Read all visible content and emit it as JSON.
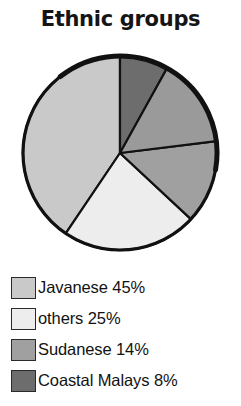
{
  "chart_data": {
    "type": "pie",
    "title": "Ethnic groups",
    "xlabel": "",
    "ylabel": "",
    "legend_position": "bottom",
    "grid": false,
    "categories": [
      "Javanese",
      "others",
      "Sudanese",
      "Coastal Malays",
      ""
    ],
    "values": [
      45,
      25,
      14,
      8,
      8
    ],
    "slices": [
      {
        "label": "Javanese",
        "value": 45,
        "value_label": "45%",
        "legend_text": "Javanese 45%",
        "color": "#c9c9c9",
        "start_angle_deg": 214,
        "end_angle_deg": 360
      },
      {
        "label": "others",
        "value": 25,
        "value_label": "25%",
        "legend_text": "others 25%",
        "color": "#ededed",
        "start_angle_deg": 133,
        "end_angle_deg": 214
      },
      {
        "label": "Sudanese",
        "value": 14,
        "value_label": "14%",
        "legend_text": "Sudanese 14%",
        "color": "#a0a0a0",
        "start_angle_deg": 83,
        "end_angle_deg": 133
      },
      {
        "label": "Coastal Malays",
        "value": 8,
        "value_label": "8%",
        "legend_text": "Coastal Malays 8%",
        "color": "#6d6d6d",
        "start_angle_deg": 0,
        "end_angle_deg": 29
      },
      {
        "label": "",
        "value": 8,
        "value_label": "",
        "legend_text": "",
        "color": "#9a9a9a",
        "start_angle_deg": 29,
        "end_angle_deg": 83
      }
    ],
    "outline_color": "#111111"
  },
  "legend": {
    "items": [
      {
        "label": "Javanese 45%",
        "color": "#c9c9c9"
      },
      {
        "label": "others 25%",
        "color": "#ededed"
      },
      {
        "label": "Sudanese 14%",
        "color": "#a0a0a0"
      },
      {
        "label": "Coastal Malays 8%",
        "color": "#6d6d6d"
      }
    ]
  }
}
